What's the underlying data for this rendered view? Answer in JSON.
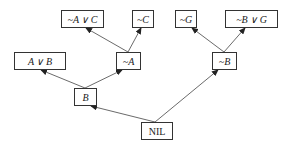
{
  "diagram": {
    "type": "resolution-tree",
    "nodes": [
      {
        "id": "n1",
        "label": "~A ∨ C",
        "x": 61,
        "y": 10,
        "w": 43,
        "h": 18
      },
      {
        "id": "n2",
        "label": "~C",
        "x": 132,
        "y": 10,
        "w": 22,
        "h": 18
      },
      {
        "id": "n3",
        "label": "~G",
        "x": 175,
        "y": 10,
        "w": 22,
        "h": 18
      },
      {
        "id": "n4",
        "label": "~B ∨ G",
        "x": 225,
        "y": 10,
        "w": 53,
        "h": 18
      },
      {
        "id": "n5",
        "label": "A ∨ B",
        "x": 14,
        "y": 52,
        "w": 52,
        "h": 18
      },
      {
        "id": "n6",
        "label": "~A",
        "x": 116,
        "y": 52,
        "w": 25,
        "h": 18
      },
      {
        "id": "n7",
        "label": "~B",
        "x": 212,
        "y": 52,
        "w": 25,
        "h": 18
      },
      {
        "id": "n8",
        "label": "B",
        "x": 74,
        "y": 88,
        "w": 23,
        "h": 18
      },
      {
        "id": "n9",
        "label": "NIL",
        "x": 141,
        "y": 122,
        "w": 32,
        "h": 18
      }
    ],
    "edges": [
      {
        "from": "n6",
        "to": "n1"
      },
      {
        "from": "n6",
        "to": "n2"
      },
      {
        "from": "n7",
        "to": "n3"
      },
      {
        "from": "n7",
        "to": "n4"
      },
      {
        "from": "n8",
        "to": "n5"
      },
      {
        "from": "n8",
        "to": "n6"
      },
      {
        "from": "n9",
        "to": "n8"
      },
      {
        "from": "n9",
        "to": "n7"
      }
    ]
  }
}
